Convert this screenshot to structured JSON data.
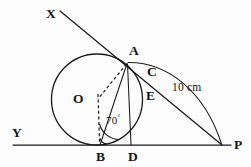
{
  "figure": {
    "type": "geometry-diagram",
    "background_color": "#fdfdfd",
    "stroke_color": "#1a1a1a"
  },
  "labels": {
    "x": "X",
    "y": "Y",
    "p": "P",
    "a": "A",
    "b": "B",
    "c": "C",
    "d": "D",
    "e": "E",
    "o": "O",
    "angle": "70",
    "angle_unit": "°",
    "measure": "10 cm"
  },
  "points": {
    "X": {
      "x": 60,
      "y": 11
    },
    "A": {
      "x": 127,
      "y": 63
    },
    "C": {
      "x": 144,
      "y": 71
    },
    "E": {
      "x": 142,
      "y": 94
    },
    "P": {
      "x": 222,
      "y": 145
    },
    "B": {
      "x": 100,
      "y": 145
    },
    "D": {
      "x": 131,
      "y": 145
    },
    "O": {
      "x": 97,
      "y": 99
    },
    "Y_line_start": {
      "x": 13,
      "y": 145
    }
  },
  "circle": {
    "center_x": 97,
    "center_y": 99,
    "radius": 45.5
  },
  "measures": {
    "angle_abo_degrees": 70,
    "tangent_length_ap": "10 cm"
  }
}
